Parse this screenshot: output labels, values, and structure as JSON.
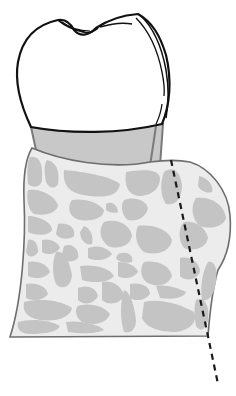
{
  "diagram": {
    "title": "",
    "colors": {
      "background": "#ffffff",
      "outline": "#111111",
      "root_fill": "#c8c8c8",
      "root_stroke": "#7a7a7a",
      "bone_matrix": "#ececec",
      "bone_cells": "#c4c4c4",
      "bone_stroke": "#6e6e6e",
      "dashed_line": "#1a1a1a"
    },
    "parts": [
      {
        "id": "crown",
        "label": ""
      },
      {
        "id": "cervical-root",
        "label": ""
      },
      {
        "id": "alveolar-bone",
        "label": ""
      },
      {
        "id": "reference-line",
        "label": "",
        "style": "dashed"
      }
    ]
  }
}
